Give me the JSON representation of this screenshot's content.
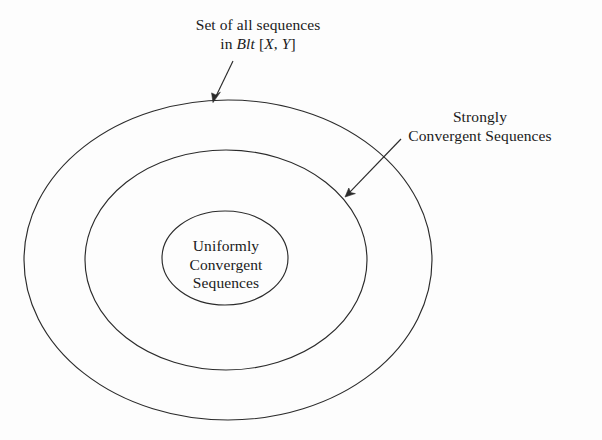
{
  "figure": {
    "type": "nested-set-venn-diagram",
    "background_color": "#fdfdfd",
    "line_color": "#2b2b2b"
  },
  "labels": {
    "universe": {
      "line1": "Set of all sequences",
      "line2_prefix": "in ",
      "line2_symbol": "Blt",
      "line2_space": " ",
      "line2_bracket_open": "[",
      "line2_var_x": "X",
      "line2_comma": ", ",
      "line2_var_y": "Y",
      "line2_bracket_close": "]"
    },
    "strongly": {
      "line1": "Strongly",
      "line2": "Convergent Sequences"
    },
    "uniformly": {
      "line1": "Uniformly",
      "line2": "Convergent",
      "line3": "Sequences"
    }
  },
  "regions": [
    {
      "name": "set-of-all-sequences",
      "label": "Set of all sequences in Blt [X, Y]",
      "shape": "ellipse",
      "cx": 228,
      "cy": 260,
      "rx": 204,
      "ry": 160
    },
    {
      "name": "strongly-convergent-sequences",
      "label": "Strongly Convergent Sequences",
      "shape": "ellipse",
      "cx": 226,
      "cy": 260,
      "rx": 141,
      "ry": 110
    },
    {
      "name": "uniformly-convergent-sequences",
      "label": "Uniformly Convergent Sequences",
      "shape": "ellipse",
      "cx": 225,
      "cy": 258,
      "rx": 63,
      "ry": 47
    }
  ],
  "leaders": [
    {
      "name": "leader-to-outer-ellipse",
      "from_x": 233,
      "from_y": 61,
      "to_x": 213,
      "to_y": 102
    },
    {
      "name": "leader-to-middle-ellipse",
      "from_x": 401,
      "from_y": 139,
      "to_x": 345,
      "to_y": 197
    }
  ]
}
